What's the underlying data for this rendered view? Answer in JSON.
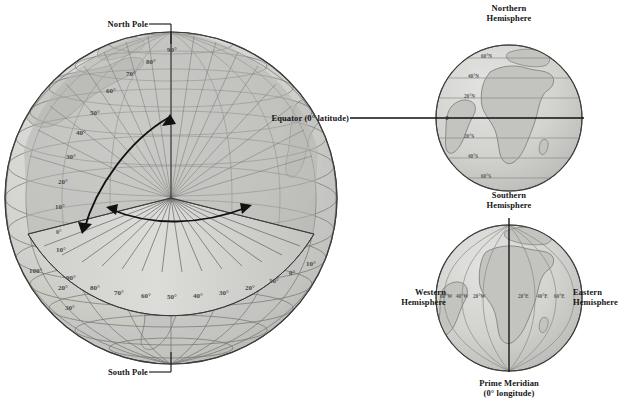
{
  "figure": {
    "background_color": "#ffffff",
    "ink_color": "#151515",
    "ocean_color": "#d8d8d6",
    "land_color": "#c9c9c6",
    "wedge_color": "#a9a9a7",
    "grid_color": "#7d7d7d"
  },
  "main_globe": {
    "name": "cutaway-globe",
    "pole_labels": {
      "north": "North Pole",
      "south": "South Pole"
    },
    "latitude_labels": [
      "90°",
      "80°",
      "70°",
      "60°",
      "50°",
      "40°",
      "30°",
      "20°",
      "10°",
      "0°"
    ],
    "latitude_left_labels": [
      "10°",
      "20°",
      "30°"
    ],
    "longitude_labels": [
      "100°",
      "90°",
      "80°",
      "70°",
      "60°",
      "50°",
      "40°",
      "30°",
      "20°",
      "10°",
      "0°",
      "10°"
    ],
    "arrows": {
      "latitude_arc": "latitude-measure-arrow",
      "longitude_arc": "longitude-measure-arrow"
    }
  },
  "hemisphere_globe_ns": {
    "name": "northern-southern-hemisphere-globe",
    "top_label": "Northern\nHemisphere",
    "top_label_line1": "Northern",
    "top_label_line2": "Hemisphere",
    "bottom_label_line1": "Southern",
    "bottom_label_line2": "Hemisphere",
    "equator_label": "Equator (0° latitude)",
    "latitude_lines": [
      "60°N",
      "40°N",
      "20°N",
      "20°S",
      "40°S",
      "60°S"
    ]
  },
  "hemisphere_globe_we": {
    "name": "western-eastern-hemisphere-globe",
    "left_label_line1": "Western",
    "left_label_line2": "Hemisphere",
    "right_label_line1": "Eastern",
    "right_label_line2": "Hemisphere",
    "bottom_label_line1": "Prime Meridian",
    "bottom_label_line2": "(0° longitude)",
    "longitude_lines_west": [
      "60°W",
      "40°W",
      "20°W"
    ],
    "longitude_lines_east": [
      "20°E",
      "40°E",
      "60°E"
    ]
  },
  "ghost_text": {
    "line1": "",
    "line2": ""
  }
}
